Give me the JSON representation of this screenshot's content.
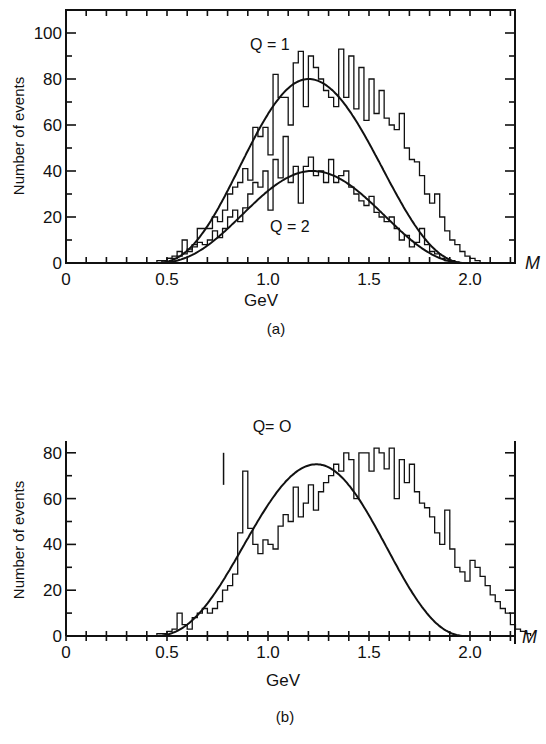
{
  "chart_data": [
    {
      "id": "a",
      "type": "bar",
      "subtype": "histogram-step-with-fit",
      "caption": "(a)",
      "xlabel": "GeV",
      "x_axis_symbol": "M",
      "ylabel": "Number of events",
      "xlim": [
        0,
        2.2
      ],
      "ylim": [
        0,
        110
      ],
      "xticks": [
        0,
        0.5,
        1.0,
        1.5,
        2.0
      ],
      "xtick_labels": [
        "0",
        "0.5",
        "1.0",
        "1.5",
        "2.0"
      ],
      "yticks": [
        0,
        20,
        40,
        60,
        80,
        100
      ],
      "ytick_labels": [
        "0",
        "20",
        "40",
        "60",
        "80",
        "100"
      ],
      "minor_x_step": 0.1,
      "minor_y_step": 10,
      "frame": "box",
      "grid": false,
      "bin_start": 0.45,
      "bin_width": 0.025,
      "series": [
        {
          "name": "Q = 1",
          "label_pos": [
            1.22,
            100
          ],
          "fit_peak": 80,
          "fit_center": 1.2,
          "fit_range": [
            0.44,
            1.98
          ],
          "values": [
            1,
            1,
            2,
            2,
            3,
            10,
            5,
            8,
            15,
            15,
            15,
            20,
            18,
            23,
            30,
            33,
            35,
            41,
            36,
            59,
            55,
            59,
            47,
            82,
            72,
            72,
            60,
            87,
            92,
            68,
            90,
            85,
            80,
            75,
            72,
            68,
            93,
            72,
            90,
            67,
            85,
            62,
            80,
            65,
            75,
            63,
            60,
            58,
            65,
            50,
            45,
            44,
            38,
            30,
            26,
            30,
            20,
            14,
            10,
            8,
            5,
            3,
            2,
            1
          ]
        },
        {
          "name": "Q = 2",
          "label_pos": [
            1.2,
            17
          ],
          "fit_peak": 40,
          "fit_center": 1.22,
          "fit_range": [
            0.44,
            1.98
          ],
          "values": [
            0,
            1,
            2,
            3,
            5,
            4,
            6,
            7,
            9,
            8,
            10,
            14,
            11,
            15,
            20,
            23,
            18,
            24,
            30,
            35,
            33,
            40,
            23,
            45,
            37,
            55,
            35,
            42,
            26,
            42,
            46,
            38,
            40,
            35,
            45,
            35,
            38,
            40,
            33,
            30,
            27,
            25,
            29,
            22,
            20,
            18,
            20,
            15,
            10,
            12,
            7,
            9,
            15,
            8,
            5,
            4,
            2,
            1,
            1,
            0,
            0,
            0,
            0,
            0
          ]
        }
      ]
    },
    {
      "id": "b",
      "type": "bar",
      "subtype": "histogram-step-with-fit",
      "caption": "(b)",
      "xlabel": "GeV",
      "x_axis_symbol": "M",
      "ylabel": "Number of events",
      "xlim": [
        0,
        2.2
      ],
      "ylim": [
        0,
        85
      ],
      "xticks": [
        0,
        0.5,
        1.0,
        1.5,
        2.0
      ],
      "xtick_labels": [
        "0",
        "0.5",
        "1.0",
        "1.5",
        "2.0"
      ],
      "yticks": [
        0,
        20,
        40,
        60,
        80
      ],
      "ytick_labels": [
        "0",
        "20",
        "40",
        "60",
        "80"
      ],
      "minor_x_step": 0.1,
      "minor_y_step": 10,
      "frame": "open-top",
      "grid": false,
      "bin_start": 0.45,
      "bin_width": 0.025,
      "annotations": [
        {
          "text": "peak with error bar near 0.78 GeV",
          "x": 0.78,
          "y": 72,
          "err": [
            66,
            80
          ]
        }
      ],
      "series": [
        {
          "name": "Q = 0",
          "label_pos": [
            1.23,
            90
          ],
          "fit_peak": 75,
          "fit_center": 1.24,
          "fit_range": [
            0.43,
            1.98
          ],
          "values": [
            1,
            1,
            2,
            3,
            10,
            5,
            3,
            8,
            10,
            12,
            10,
            12,
            15,
            20,
            22,
            27,
            45,
            72,
            47,
            40,
            36,
            42,
            40,
            38,
            48,
            53,
            50,
            65,
            52,
            58,
            66,
            55,
            63,
            67,
            70,
            75,
            72,
            80,
            77,
            60,
            80,
            80,
            72,
            82,
            80,
            73,
            82,
            60,
            77,
            67,
            75,
            63,
            58,
            56,
            52,
            45,
            40,
            55,
            38,
            30,
            28,
            24,
            33,
            30,
            26,
            22,
            18,
            15,
            12,
            10,
            5,
            3,
            2,
            1
          ]
        }
      ]
    }
  ],
  "labels": {
    "a": {
      "series1": "Q = 1",
      "series2": "Q = 2",
      "xlabel": "GeV",
      "ylabel": "Number of events",
      "caption": "(a)",
      "axis_symbol": "M",
      "xticks": [
        "0",
        "0.5",
        "1.0",
        "1.5",
        "2.0"
      ],
      "yticks": [
        "0",
        "20",
        "40",
        "60",
        "80",
        "100"
      ]
    },
    "b": {
      "series1": "Q= O",
      "xlabel": "GeV",
      "ylabel": "Number of events",
      "caption": "(b)",
      "axis_symbol": "M",
      "xticks": [
        "0",
        "0.5",
        "1.0",
        "1.5",
        "2.0"
      ],
      "yticks": [
        "0",
        "20",
        "40",
        "60",
        "80"
      ]
    }
  }
}
